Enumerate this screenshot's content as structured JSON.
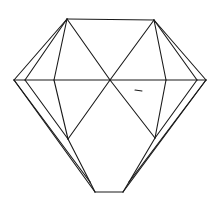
{
  "figure": {
    "background": "#ffffff",
    "stroke_color": "#1a1a1a",
    "vertices": {
      "top_left": [
        67,
        19
      ],
      "top_right": [
        154,
        20
      ],
      "left": [
        14,
        80
      ],
      "left_inner": [
        25,
        80
      ],
      "left_mid": [
        54,
        80
      ],
      "center": [
        110,
        80
      ],
      "right_mid": [
        166,
        80
      ],
      "right_inner": [
        197,
        80
      ],
      "right": [
        206,
        80
      ],
      "lower_left": [
        68,
        139
      ],
      "lower_right": [
        155,
        138
      ],
      "bottom_left_apex": [
        90,
        182
      ],
      "bottom_right_apex": [
        129,
        182
      ],
      "culet_left": [
        95,
        192
      ],
      "culet_right": [
        123,
        192
      ]
    }
  }
}
